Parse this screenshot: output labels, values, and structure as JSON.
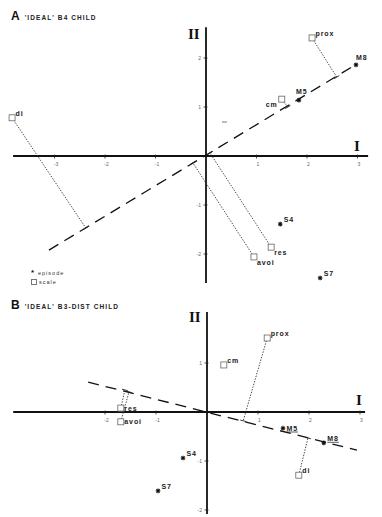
{
  "chart_data": [
    {
      "type": "scatter",
      "panel": "A",
      "title": "'IDEAL' B4 CHILD",
      "xlabel": "I",
      "ylabel": "II",
      "xlim": [
        -3.82,
        3.21
      ],
      "ylim": [
        -2.59,
        2.63
      ],
      "grid": false,
      "xticks": [
        {
          "value": -3,
          "label": "-3"
        },
        {
          "value": -2,
          "label": "-2"
        },
        {
          "value": -1,
          "label": "-1"
        },
        {
          "value": 1,
          "label": "1"
        },
        {
          "value": 2,
          "label": "2"
        },
        {
          "value": 3,
          "label": "3"
        }
      ],
      "yticks": [
        {
          "value": 2,
          "label": "2"
        },
        {
          "value": 1,
          "label": "1"
        },
        {
          "value": -1,
          "label": "-1"
        },
        {
          "value": -2,
          "label": "-2"
        }
      ],
      "series": [
        {
          "name": "episode",
          "marker": "star",
          "points": [
            {
              "label": "M8",
              "x": 2.97,
              "y": 1.86,
              "label_pos": "n"
            },
            {
              "label": "M5",
              "x": 1.84,
              "y": 1.14,
              "label_pos": "nw"
            },
            {
              "label": "S4",
              "x": 1.47,
              "y": -1.39,
              "label_pos": "ne"
            },
            {
              "label": "S7",
              "x": 2.26,
              "y": -2.49,
              "label_pos": "ne"
            }
          ]
        },
        {
          "name": "scale",
          "marker": "square",
          "points": [
            {
              "label": "prox",
              "x": 2.1,
              "y": 2.41,
              "label_pos": "ne"
            },
            {
              "label": "cm",
              "x": 1.5,
              "y": 1.16,
              "label_pos": "sw"
            },
            {
              "label": "di",
              "x": -3.84,
              "y": 0.78,
              "label_pos": "ne"
            },
            {
              "label": "res",
              "x": 1.29,
              "y": -1.86,
              "label_pos": "se"
            },
            {
              "label": "avoi",
              "x": 0.95,
              "y": -2.06,
              "label_pos": "se"
            }
          ]
        }
      ],
      "fit_line": {
        "style": "dashed",
        "from": [
          -3.11,
          -1.92
        ],
        "to": [
          2.99,
          1.88
        ]
      },
      "projections": [
        {
          "label": "di",
          "from": [
            -3.84,
            0.78
          ],
          "to": [
            -2.38,
            -1.47
          ]
        },
        {
          "label": "prox",
          "from": [
            2.1,
            2.41
          ],
          "to": [
            2.59,
            1.61
          ]
        },
        {
          "label": "cm",
          "from": [
            1.5,
            1.16
          ],
          "to": [
            1.62,
            1.0
          ]
        },
        {
          "label": "res",
          "from": [
            1.29,
            -1.86
          ],
          "to": [
            0.08,
            0.06
          ]
        },
        {
          "label": "avoi",
          "from": [
            0.95,
            -2.06
          ],
          "to": [
            -0.26,
            -0.14
          ]
        }
      ]
    },
    {
      "type": "scatter",
      "panel": "B",
      "title": "'IDEAL' B3-DIST CHILD",
      "xlabel": "I",
      "ylabel": "II",
      "xlim": [
        -3.8,
        3.1
      ],
      "ylim": [
        -2.08,
        2.04
      ],
      "grid": false,
      "xticks": [
        {
          "value": -2,
          "label": "-2"
        },
        {
          "value": -1,
          "label": "-1"
        },
        {
          "value": 1,
          "label": "1"
        },
        {
          "value": 2,
          "label": "2"
        },
        {
          "value": 3,
          "label": "3"
        }
      ],
      "yticks": [
        {
          "value": 1,
          "label": "1"
        },
        {
          "value": -1,
          "label": "-1"
        },
        {
          "value": -2,
          "label": "-2"
        }
      ],
      "series": [
        {
          "name": "episode",
          "marker": "star",
          "points": [
            {
              "label": "M5",
              "x": 1.49,
              "y": -0.33,
              "label_pos": "e",
              "underlined": true
            },
            {
              "label": "M8",
              "x": 2.29,
              "y": -0.63,
              "label_pos": "ne",
              "underlined": true
            },
            {
              "label": "S4",
              "x": -0.47,
              "y": -0.94,
              "label_pos": "ne"
            },
            {
              "label": "S7",
              "x": -0.96,
              "y": -1.61,
              "label_pos": "ne"
            }
          ]
        },
        {
          "name": "scale",
          "marker": "square",
          "points": [
            {
              "label": "prox",
              "x": 1.18,
              "y": 1.51,
              "label_pos": "ne"
            },
            {
              "label": "cm",
              "x": 0.33,
              "y": 0.96,
              "label_pos": "ne"
            },
            {
              "label": "di",
              "x": 1.8,
              "y": -1.29,
              "label_pos": "ne"
            },
            {
              "label": "res",
              "x": -1.69,
              "y": 0.08,
              "label_pos": "e"
            },
            {
              "label": "avoi",
              "x": -1.69,
              "y": -0.2,
              "label_pos": "e"
            }
          ]
        }
      ],
      "fit_line": {
        "style": "dashed",
        "from": [
          -2.33,
          0.61
        ],
        "to": [
          2.94,
          -0.78
        ]
      },
      "projections": [
        {
          "label": "prox",
          "from": [
            1.18,
            1.51
          ],
          "to": [
            0.71,
            -0.18
          ]
        },
        {
          "label": "res",
          "from": [
            -1.69,
            0.08
          ],
          "to": [
            -1.61,
            0.45
          ]
        },
        {
          "label": "avoi",
          "from": [
            -1.69,
            -0.2
          ],
          "to": [
            -1.53,
            0.41
          ]
        },
        {
          "label": "di",
          "from": [
            1.8,
            -1.29
          ],
          "to": [
            1.98,
            -0.53
          ]
        }
      ]
    }
  ],
  "legend": {
    "position": "below-panel-A-left",
    "items": [
      {
        "marker": "star",
        "label": "episode"
      },
      {
        "marker": "square",
        "label": "scale"
      }
    ]
  }
}
